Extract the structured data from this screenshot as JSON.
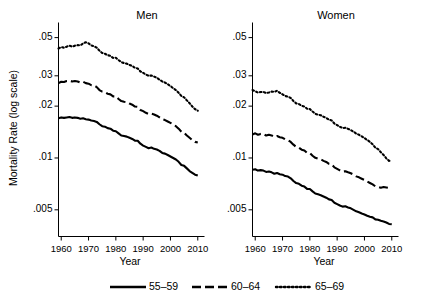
{
  "chart_data": {
    "type": "line",
    "title": "",
    "xlabel": "Year",
    "ylabel": "Mortality Rate (log scale)",
    "y_scale": "log",
    "ylim": [
      0.0035,
      0.058
    ],
    "xlim": [
      1959,
      2011
    ],
    "grid": false,
    "legend_position": "bottom",
    "y_ticks": [
      0.05,
      0.03,
      0.02,
      0.01,
      0.005
    ],
    "y_tick_labels": [
      ".05",
      ".03",
      ".02",
      ".01",
      ".005"
    ],
    "x_ticks": [
      1960,
      1970,
      1980,
      1990,
      2000,
      2010
    ],
    "x_tick_labels": [
      "1960",
      "1970",
      "1980",
      "1990",
      "2000",
      "2010"
    ],
    "legend": [
      {
        "label": "55–59",
        "style": "solid"
      },
      {
        "label": "60–64",
        "style": "dashed"
      },
      {
        "label": "65–69",
        "style": "dotted"
      }
    ],
    "panels": [
      {
        "title": "Men",
        "x": [
          1959,
          1960,
          1961,
          1962,
          1963,
          1964,
          1965,
          1966,
          1967,
          1968,
          1969,
          1970,
          1971,
          1972,
          1973,
          1974,
          1975,
          1976,
          1977,
          1978,
          1979,
          1980,
          1981,
          1982,
          1983,
          1984,
          1985,
          1986,
          1987,
          1988,
          1989,
          1990,
          1991,
          1992,
          1993,
          1994,
          1995,
          1996,
          1997,
          1998,
          1999,
          2000,
          2001,
          2002,
          2003,
          2004,
          2005,
          2006,
          2007,
          2008,
          2009,
          2010
        ],
        "series": [
          {
            "name": "55–59",
            "style": "solid",
            "values": [
              0.017,
              0.0172,
              0.0171,
              0.0172,
              0.0173,
              0.0171,
              0.0172,
              0.0171,
              0.0169,
              0.017,
              0.0168,
              0.0167,
              0.0165,
              0.0164,
              0.0162,
              0.0157,
              0.0153,
              0.0152,
              0.0149,
              0.0148,
              0.0144,
              0.0143,
              0.0139,
              0.0135,
              0.0134,
              0.0133,
              0.0131,
              0.0129,
              0.0126,
              0.0126,
              0.0121,
              0.0118,
              0.0116,
              0.0114,
              0.0115,
              0.0113,
              0.0112,
              0.011,
              0.0107,
              0.0106,
              0.0104,
              0.0102,
              0.01,
              0.0098,
              0.0095,
              0.0091,
              0.009,
              0.0087,
              0.0084,
              0.0082,
              0.008,
              0.0079
            ]
          },
          {
            "name": "60–64",
            "style": "dashed",
            "values": [
              0.0272,
              0.0277,
              0.0276,
              0.028,
              0.0281,
              0.0278,
              0.028,
              0.0278,
              0.0274,
              0.0277,
              0.0272,
              0.027,
              0.0265,
              0.0264,
              0.0258,
              0.0248,
              0.0243,
              0.0241,
              0.0236,
              0.0234,
              0.0228,
              0.0228,
              0.022,
              0.0214,
              0.0212,
              0.0211,
              0.0207,
              0.0204,
              0.0199,
              0.0198,
              0.019,
              0.0187,
              0.0183,
              0.018,
              0.0181,
              0.0179,
              0.0176,
              0.0172,
              0.0168,
              0.0166,
              0.0163,
              0.016,
              0.0156,
              0.0153,
              0.0148,
              0.0142,
              0.014,
              0.0135,
              0.0131,
              0.0127,
              0.0124,
              0.0123
            ]
          },
          {
            "name": "65–69",
            "style": "dotted",
            "values": [
              0.0432,
              0.044,
              0.0437,
              0.0443,
              0.0449,
              0.0443,
              0.0449,
              0.0452,
              0.0451,
              0.0462,
              0.047,
              0.0463,
              0.045,
              0.0445,
              0.0437,
              0.042,
              0.0407,
              0.0403,
              0.0395,
              0.0392,
              0.0381,
              0.0382,
              0.037,
              0.036,
              0.0356,
              0.0353,
              0.0347,
              0.0342,
              0.0334,
              0.0331,
              0.0318,
              0.0312,
              0.0305,
              0.03,
              0.0301,
              0.0297,
              0.0292,
              0.0285,
              0.0278,
              0.0274,
              0.0268,
              0.0262,
              0.0254,
              0.0248,
              0.0239,
              0.0229,
              0.0225,
              0.0216,
              0.0208,
              0.0199,
              0.0192,
              0.0188
            ]
          }
        ]
      },
      {
        "title": "Women",
        "x": [
          1959,
          1960,
          1961,
          1962,
          1963,
          1964,
          1965,
          1966,
          1967,
          1968,
          1969,
          1970,
          1971,
          1972,
          1973,
          1974,
          1975,
          1976,
          1977,
          1978,
          1979,
          1980,
          1981,
          1982,
          1983,
          1984,
          1985,
          1986,
          1987,
          1988,
          1989,
          1990,
          1991,
          1992,
          1993,
          1994,
          1995,
          1996,
          1997,
          1998,
          1999,
          2000,
          2001,
          2002,
          2003,
          2004,
          2005,
          2006,
          2007,
          2008,
          2009,
          2010
        ],
        "series": [
          {
            "name": "55–59",
            "style": "solid",
            "values": [
              0.00855,
              0.0086,
              0.00845,
              0.0085,
              0.00845,
              0.0083,
              0.00835,
              0.00825,
              0.0081,
              0.00818,
              0.00805,
              0.008,
              0.00785,
              0.0078,
              0.00762,
              0.00735,
              0.00715,
              0.00708,
              0.0069,
              0.00682,
              0.00662,
              0.0066,
              0.0064,
              0.00622,
              0.00615,
              0.00608,
              0.00598,
              0.00588,
              0.00575,
              0.0057,
              0.0055,
              0.0054,
              0.0053,
              0.00522,
              0.00524,
              0.00516,
              0.0051,
              0.005,
              0.0049,
              0.00484,
              0.00476,
              0.0047,
              0.00462,
              0.00456,
              0.00452,
              0.0044,
              0.00438,
              0.00432,
              0.00428,
              0.00422,
              0.00414,
              0.00412
            ]
          },
          {
            "name": "60–64",
            "style": "dashed",
            "values": [
              0.0137,
              0.0139,
              0.01365,
              0.0138,
              0.01382,
              0.0135,
              0.01365,
              0.01352,
              0.01325,
              0.0134,
              0.0132,
              0.0131,
              0.01282,
              0.0127,
              0.0124,
              0.01195,
              0.0116,
              0.01148,
              0.01118,
              0.01105,
              0.0107,
              0.01068,
              0.0103,
              0.01002,
              0.0099,
              0.00982,
              0.00962,
              0.00948,
              0.00925,
              0.00918,
              0.00882,
              0.00865,
              0.00848,
              0.00834,
              0.00838,
              0.00826,
              0.00815,
              0.008,
              0.00782,
              0.00772,
              0.00758,
              0.00745,
              0.0073,
              0.00716,
              0.00702,
              0.00684,
              0.0068,
              0.00672,
              0.00678,
              0.00674,
              0.0067,
              0.00674
            ]
          },
          {
            "name": "65–69",
            "style": "dotted",
            "values": [
              0.0248,
              0.0244,
              0.024,
              0.02415,
              0.0242,
              0.0238,
              0.024,
              0.0243,
              0.0242,
              0.02455,
              0.0239,
              0.0234,
              0.0229,
              0.0227,
              0.0223,
              0.0214,
              0.02075,
              0.02055,
              0.0201,
              0.0199,
              0.0193,
              0.01925,
              0.0186,
              0.01805,
              0.01785,
              0.0177,
              0.01735,
              0.0171,
              0.01668,
              0.0165,
              0.01585,
              0.01552,
              0.01518,
              0.01492,
              0.01498,
              0.01476,
              0.01452,
              0.0142,
              0.01385,
              0.01364,
              0.01336,
              0.01305,
              0.01272,
              0.0124,
              0.012,
              0.01148,
              0.01125,
              0.0108,
              0.01042,
              0.00995,
              0.00962,
              0.00968
            ]
          }
        ]
      }
    ]
  }
}
